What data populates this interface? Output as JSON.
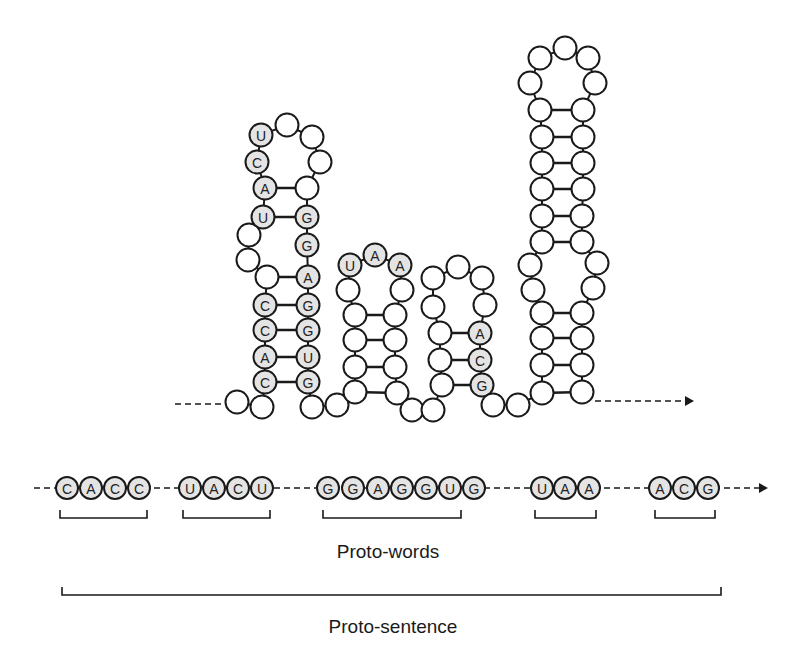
{
  "colors": {
    "stroke": "#1a1a1a",
    "filled": "#e4e4e4",
    "empty": "#ffffff",
    "background": "#ffffff"
  },
  "structure": {
    "radius": 11.5,
    "nucleotides": [
      {
        "x": 237,
        "y": 402,
        "l": ""
      },
      {
        "x": 262,
        "y": 407,
        "l": ""
      },
      {
        "x": 265,
        "y": 382,
        "l": "C"
      },
      {
        "x": 265,
        "y": 357,
        "l": "A"
      },
      {
        "x": 265,
        "y": 330,
        "l": "C"
      },
      {
        "x": 265,
        "y": 305,
        "l": "C"
      },
      {
        "x": 267,
        "y": 277,
        "l": ""
      },
      {
        "x": 248,
        "y": 260,
        "l": ""
      },
      {
        "x": 249,
        "y": 235,
        "l": ""
      },
      {
        "x": 263,
        "y": 217,
        "l": "U"
      },
      {
        "x": 265,
        "y": 188,
        "l": "A"
      },
      {
        "x": 257,
        "y": 162,
        "l": "C"
      },
      {
        "x": 261,
        "y": 135,
        "l": "U"
      },
      {
        "x": 287,
        "y": 125,
        "l": ""
      },
      {
        "x": 312,
        "y": 137,
        "l": ""
      },
      {
        "x": 320,
        "y": 162,
        "l": ""
      },
      {
        "x": 307,
        "y": 188,
        "l": ""
      },
      {
        "x": 307,
        "y": 217,
        "l": "G"
      },
      {
        "x": 307,
        "y": 245,
        "l": "G"
      },
      {
        "x": 308,
        "y": 277,
        "l": "A"
      },
      {
        "x": 308,
        "y": 305,
        "l": "G"
      },
      {
        "x": 308,
        "y": 330,
        "l": "G"
      },
      {
        "x": 308,
        "y": 357,
        "l": "U"
      },
      {
        "x": 308,
        "y": 382,
        "l": "G"
      },
      {
        "x": 312,
        "y": 407,
        "l": ""
      },
      {
        "x": 337,
        "y": 405,
        "l": ""
      },
      {
        "x": 355,
        "y": 392,
        "l": ""
      },
      {
        "x": 355,
        "y": 367,
        "l": ""
      },
      {
        "x": 355,
        "y": 340,
        "l": ""
      },
      {
        "x": 355,
        "y": 315,
        "l": ""
      },
      {
        "x": 348,
        "y": 290,
        "l": ""
      },
      {
        "x": 350,
        "y": 265,
        "l": "U"
      },
      {
        "x": 375,
        "y": 255,
        "l": "A"
      },
      {
        "x": 400,
        "y": 265,
        "l": "A"
      },
      {
        "x": 402,
        "y": 290,
        "l": ""
      },
      {
        "x": 395,
        "y": 315,
        "l": ""
      },
      {
        "x": 395,
        "y": 340,
        "l": ""
      },
      {
        "x": 395,
        "y": 367,
        "l": ""
      },
      {
        "x": 397,
        "y": 393,
        "l": ""
      },
      {
        "x": 412,
        "y": 410,
        "l": ""
      },
      {
        "x": 433,
        "y": 410,
        "l": ""
      },
      {
        "x": 442,
        "y": 385,
        "l": ""
      },
      {
        "x": 440,
        "y": 360,
        "l": ""
      },
      {
        "x": 440,
        "y": 333,
        "l": ""
      },
      {
        "x": 433,
        "y": 307,
        "l": ""
      },
      {
        "x": 433,
        "y": 278,
        "l": ""
      },
      {
        "x": 458,
        "y": 267,
        "l": ""
      },
      {
        "x": 482,
        "y": 278,
        "l": ""
      },
      {
        "x": 485,
        "y": 305,
        "l": ""
      },
      {
        "x": 480,
        "y": 333,
        "l": "A"
      },
      {
        "x": 480,
        "y": 360,
        "l": "C"
      },
      {
        "x": 482,
        "y": 385,
        "l": "G"
      },
      {
        "x": 493,
        "y": 405,
        "l": ""
      },
      {
        "x": 518,
        "y": 405,
        "l": ""
      },
      {
        "x": 542,
        "y": 393,
        "l": ""
      },
      {
        "x": 542,
        "y": 365,
        "l": ""
      },
      {
        "x": 542,
        "y": 338,
        "l": ""
      },
      {
        "x": 542,
        "y": 313,
        "l": ""
      },
      {
        "x": 533,
        "y": 290,
        "l": ""
      },
      {
        "x": 530,
        "y": 265,
        "l": ""
      },
      {
        "x": 542,
        "y": 242,
        "l": ""
      },
      {
        "x": 542,
        "y": 216,
        "l": ""
      },
      {
        "x": 542,
        "y": 189,
        "l": ""
      },
      {
        "x": 542,
        "y": 163,
        "l": ""
      },
      {
        "x": 542,
        "y": 137,
        "l": ""
      },
      {
        "x": 540,
        "y": 110,
        "l": ""
      },
      {
        "x": 530,
        "y": 83,
        "l": ""
      },
      {
        "x": 540,
        "y": 58,
        "l": ""
      },
      {
        "x": 565,
        "y": 48,
        "l": ""
      },
      {
        "x": 588,
        "y": 58,
        "l": ""
      },
      {
        "x": 595,
        "y": 83,
        "l": ""
      },
      {
        "x": 583,
        "y": 110,
        "l": ""
      },
      {
        "x": 583,
        "y": 137,
        "l": ""
      },
      {
        "x": 583,
        "y": 163,
        "l": ""
      },
      {
        "x": 583,
        "y": 189,
        "l": ""
      },
      {
        "x": 582,
        "y": 216,
        "l": ""
      },
      {
        "x": 582,
        "y": 242,
        "l": ""
      },
      {
        "x": 597,
        "y": 263,
        "l": ""
      },
      {
        "x": 593,
        "y": 288,
        "l": ""
      },
      {
        "x": 582,
        "y": 313,
        "l": ""
      },
      {
        "x": 582,
        "y": 338,
        "l": ""
      },
      {
        "x": 582,
        "y": 365,
        "l": ""
      },
      {
        "x": 582,
        "y": 392,
        "l": ""
      }
    ],
    "pairs": [
      [
        265,
        188,
        307,
        188
      ],
      [
        263,
        217,
        307,
        217
      ],
      [
        267,
        277,
        308,
        277
      ],
      [
        265,
        305,
        308,
        305
      ],
      [
        265,
        330,
        308,
        330
      ],
      [
        265,
        357,
        308,
        357
      ],
      [
        265,
        382,
        308,
        382
      ],
      [
        355,
        315,
        395,
        315
      ],
      [
        355,
        340,
        395,
        340
      ],
      [
        355,
        367,
        395,
        367
      ],
      [
        355,
        392,
        397,
        393
      ],
      [
        440,
        333,
        480,
        333
      ],
      [
        440,
        360,
        480,
        360
      ],
      [
        442,
        385,
        482,
        385
      ],
      [
        540,
        110,
        583,
        110
      ],
      [
        542,
        137,
        583,
        137
      ],
      [
        542,
        163,
        583,
        163
      ],
      [
        542,
        189,
        583,
        189
      ],
      [
        542,
        216,
        582,
        216
      ],
      [
        542,
        242,
        582,
        242
      ],
      [
        542,
        313,
        582,
        313
      ],
      [
        542,
        338,
        582,
        338
      ],
      [
        542,
        365,
        582,
        365
      ],
      [
        542,
        393,
        582,
        392
      ]
    ],
    "lead_line": {
      "x1": 175,
      "y1": 404,
      "x2": 225,
      "y2": 404
    },
    "tail_line": {
      "x1": 595,
      "y1": 401,
      "x2": 686,
      "y2": 401
    },
    "tail_arrow_tip": {
      "x": 694,
      "y": 401
    }
  },
  "sequence_row": {
    "y": 488,
    "radius": 11,
    "words": [
      {
        "letters": [
          "C",
          "A",
          "C",
          "C"
        ],
        "xs": [
          67,
          91,
          115,
          139
        ],
        "bracket": [
          60,
          147
        ]
      },
      {
        "letters": [
          "U",
          "A",
          "C",
          "U"
        ],
        "xs": [
          190,
          214,
          238,
          262
        ],
        "bracket": [
          183,
          270
        ]
      },
      {
        "letters": [
          "G",
          "G",
          "A",
          "G",
          "G",
          "U",
          "G"
        ],
        "xs": [
          328,
          353,
          378,
          402,
          426,
          450,
          474
        ],
        "bracket": [
          323,
          461
        ]
      },
      {
        "letters": [
          "U",
          "A",
          "A"
        ],
        "xs": [
          542,
          565,
          589
        ],
        "bracket": [
          535,
          596
        ]
      },
      {
        "letters": [
          "A",
          "C",
          "G"
        ],
        "xs": [
          660,
          684,
          708
        ],
        "bracket": [
          655,
          715
        ]
      }
    ],
    "line_start": 34,
    "arrow_tip": 768,
    "bracket_top": 510,
    "bracket_bottom": 518
  },
  "proto_sentence_bracket": {
    "x1": 62,
    "x2": 721,
    "top": 587,
    "bottom": 595
  },
  "labels": {
    "proto_words": "Proto-words",
    "proto_sentence": "Proto-sentence"
  }
}
